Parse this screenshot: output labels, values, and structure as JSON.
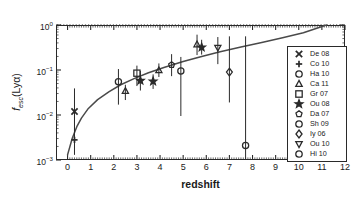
{
  "chart_data": {
    "type": "scatter",
    "title": "",
    "xlabel": "redshift",
    "ylabel": "f_esc(Lyα)",
    "xlim": [
      -0.5,
      12
    ],
    "ylim": [
      0.001,
      1.6
    ],
    "yscale": "log",
    "grid": false,
    "legend_position": "right",
    "xticks": [
      "0",
      "1",
      "2",
      "3",
      "4",
      "5",
      "6",
      "7",
      "8",
      "9",
      "10",
      "11",
      "12"
    ],
    "yticks": [
      "10^0",
      "10^-1",
      "10^-2",
      "10^-3"
    ],
    "reference_line": {
      "y": 1.0,
      "style": "dotted",
      "label": ""
    },
    "model_curve": {
      "name": "best-fit evolution",
      "style": "solid",
      "x": [
        0.0,
        0.2,
        0.4,
        0.6,
        0.9,
        1.3,
        1.8,
        2.3,
        2.9,
        3.5,
        4.2,
        5.0,
        5.8,
        6.6,
        7.5,
        8.4,
        9.3,
        10.2,
        11.2
      ],
      "y": [
        0.0013,
        0.003,
        0.0055,
        0.0085,
        0.014,
        0.022,
        0.033,
        0.047,
        0.065,
        0.087,
        0.115,
        0.155,
        0.2,
        0.255,
        0.325,
        0.41,
        0.52,
        0.67,
        1.0
      ]
    },
    "points": [
      {
        "label": "De 08",
        "marker": "x",
        "x": 0.3,
        "y": 0.012,
        "yerr_low": 0.0039,
        "yerr_high": 0.039
      },
      {
        "label": "Co 10",
        "marker": "plus",
        "x": 0.3,
        "y": 0.0028,
        "yerr_low": 0.0013,
        "yerr_high": 0.012
      },
      {
        "label": "Ha 10",
        "marker": "circle",
        "x": 2.2,
        "y": 0.055,
        "yerr_low": 0.017,
        "yerr_high": 0.105
      },
      {
        "label": "Ca 11",
        "marker": "triangle",
        "x": 2.5,
        "y": 0.034,
        "yerr_low": 0.0215,
        "yerr_high": 0.047
      },
      {
        "label": "Gr 07",
        "marker": "square",
        "x": 3.0,
        "y": 0.085,
        "yerr_low": 0.044,
        "yerr_high": 0.125
      },
      {
        "label": "Ou 08",
        "marker": "star",
        "x": 3.15,
        "y": 0.058,
        "yerr_low": 0.035,
        "yerr_high": 0.095
      },
      {
        "label": "Ou 08",
        "marker": "star",
        "x": 3.7,
        "y": 0.056,
        "yerr_low": 0.038,
        "yerr_high": 0.08
      },
      {
        "label": "Ca 11",
        "marker": "triangle",
        "x": 3.95,
        "y": 0.098,
        "yerr_low": 0.07,
        "yerr_high": 0.14
      },
      {
        "label": "Da 07",
        "marker": "pentagon",
        "x": 4.5,
        "y": 0.13,
        "yerr_low": 0.073,
        "yerr_high": 0.225
      },
      {
        "label": "Sh 09",
        "marker": "circle",
        "x": 4.9,
        "y": 0.095,
        "yerr_low": 0.0095,
        "yerr_high": 0.195
      },
      {
        "label": "Ca 11",
        "marker": "triangle",
        "x": 5.6,
        "y": 0.37,
        "yerr_low": 0.215,
        "yerr_high": 0.61
      },
      {
        "label": "Ou 08",
        "marker": "star",
        "x": 5.8,
        "y": 0.32,
        "yerr_low": 0.22,
        "yerr_high": 0.47
      },
      {
        "label": "Ou 10",
        "marker": "invtriangle",
        "x": 6.5,
        "y": 0.315,
        "yerr_low": 0.135,
        "yerr_high": 0.54
      },
      {
        "label": "Iy 06",
        "marker": "diamond",
        "x": 7.0,
        "y": 0.09,
        "yerr_low": 0.019,
        "yerr_high": 0.56
      },
      {
        "label": "Hi 10",
        "marker": "circle",
        "x": 7.7,
        "y": 0.0021,
        "yerr_low": 0.001,
        "yerr_high": 0.56
      }
    ],
    "legend": [
      {
        "label": "De 08",
        "marker": "x"
      },
      {
        "label": "Co 10",
        "marker": "plus"
      },
      {
        "label": "Ha 10",
        "marker": "circle"
      },
      {
        "label": "Ca 11",
        "marker": "triangle"
      },
      {
        "label": "Gr 07",
        "marker": "square"
      },
      {
        "label": "Ou 08",
        "marker": "star"
      },
      {
        "label": "Da 07",
        "marker": "pentagon"
      },
      {
        "label": "Sh 09",
        "marker": "circle"
      },
      {
        "label": "Iy 06",
        "marker": "diamond"
      },
      {
        "label": "Ou 10",
        "marker": "invtriangle"
      },
      {
        "label": "Hi 10",
        "marker": "circle"
      }
    ],
    "colors": {
      "ink": "#2a2a2a",
      "curve": "#4a4a4a",
      "background": "#ffffff"
    }
  },
  "axes": {
    "x_title": "redshift",
    "y_title_main": "f",
    "y_title_sub": "esc",
    "y_title_tail": "(Lyα)"
  }
}
